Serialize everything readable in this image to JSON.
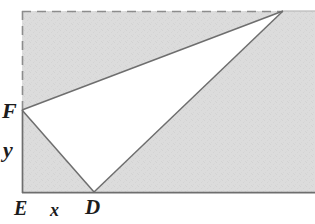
{
  "figure": {
    "width": 315,
    "height": 224,
    "colors": {
      "background": "#ffffff",
      "shading": "#dcdcdc",
      "shading_texture": "#d2d2d2",
      "stroke": "#6e6e6e",
      "dashed_stroke": "#8c8c8c",
      "label_text": "#1c1c1c"
    },
    "points": {
      "E": {
        "x": 22,
        "y": 193,
        "label": "E"
      },
      "D": {
        "x": 94,
        "y": 192,
        "label": "D"
      },
      "F": {
        "x": 22,
        "y": 110,
        "label": "F"
      },
      "C": {
        "x": 283,
        "y": 11,
        "label": ""
      }
    },
    "segment_labels": {
      "x": "x",
      "y": "y"
    },
    "labels": [
      {
        "name": "F",
        "text": "F"
      },
      {
        "name": "y",
        "text": "y"
      },
      {
        "name": "E",
        "text": "E"
      },
      {
        "name": "x",
        "text": "x"
      },
      {
        "name": "D",
        "text": "D"
      }
    ],
    "dashed_edges": [
      {
        "name": "top-edge",
        "from": "top-left",
        "to": "C"
      },
      {
        "name": "left-upper-edge",
        "from": "top-left",
        "to": "F"
      }
    ],
    "solid_edges": [
      {
        "name": "left-lower-edge",
        "from": "F",
        "to": "E"
      },
      {
        "name": "bottom-edge",
        "from": "E",
        "to": "bottom-right"
      },
      {
        "name": "right-edge",
        "from": "C",
        "to": "bottom-right"
      },
      {
        "name": "hypotenuse-FC",
        "from": "F",
        "to": "C"
      },
      {
        "name": "hypotenuse-DC",
        "from": "D",
        "to": "C"
      },
      {
        "name": "hypotenuse-FD",
        "from": "F",
        "to": "D"
      }
    ],
    "shaded_description": "Region of the rectangle outside triangle F-D-C is shaded light gray"
  }
}
